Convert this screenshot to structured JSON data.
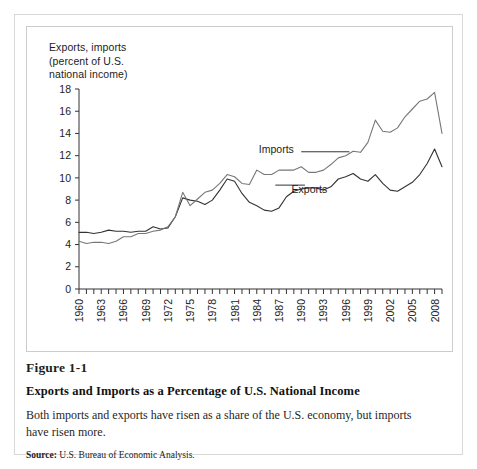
{
  "figure": {
    "number": "Figure 1-1",
    "title": "Exports and Imports as a Percentage of U.S. National Income",
    "description": "Both imports and exports have risen as a share of the U.S. economy, but imports have risen more.",
    "source_label": "Source:",
    "source_text": "U.S. Bureau of Economic Analysis."
  },
  "chart_data": {
    "type": "line",
    "title": "",
    "axis_title": "Exports, imports\n(percent of U.S.\nnational income)",
    "xlabel": "",
    "ylabel": "Exports, imports (percent of U.S. national income)",
    "ylim": [
      0,
      18
    ],
    "yticks": [
      0,
      2,
      4,
      6,
      8,
      10,
      12,
      14,
      16,
      18
    ],
    "xlim": [
      1960,
      2009
    ],
    "xticks_labeled": [
      1960,
      1963,
      1966,
      1969,
      1972,
      1975,
      1978,
      1981,
      1984,
      1987,
      1990,
      1993,
      1996,
      1999,
      2002,
      2005,
      2008
    ],
    "xtick_interval_minor": 1,
    "grid": false,
    "legend": "inline-annotations",
    "x": [
      1960,
      1961,
      1962,
      1963,
      1964,
      1965,
      1966,
      1967,
      1968,
      1969,
      1970,
      1971,
      1972,
      1973,
      1974,
      1975,
      1976,
      1977,
      1978,
      1979,
      1980,
      1981,
      1982,
      1983,
      1984,
      1985,
      1986,
      1987,
      1988,
      1989,
      1990,
      1991,
      1992,
      1993,
      1994,
      1995,
      1996,
      1997,
      1998,
      1999,
      2000,
      2001,
      2002,
      2003,
      2004,
      2005,
      2006,
      2007,
      2008,
      2009
    ],
    "series": [
      {
        "name": "Exports",
        "color": "#333333",
        "values": [
          5.1,
          5.1,
          5.0,
          5.1,
          5.3,
          5.2,
          5.2,
          5.1,
          5.2,
          5.2,
          5.6,
          5.4,
          5.5,
          6.5,
          8.2,
          8.0,
          7.9,
          7.6,
          8.0,
          8.9,
          9.9,
          9.7,
          8.6,
          7.8,
          7.5,
          7.1,
          7.0,
          7.3,
          8.3,
          8.8,
          9.0,
          9.1,
          9.1,
          8.9,
          9.2,
          9.9,
          10.1,
          10.4,
          9.9,
          9.7,
          10.3,
          9.5,
          8.9,
          8.8,
          9.2,
          9.6,
          10.3,
          11.3,
          12.6,
          11.0
        ]
      },
      {
        "name": "Imports",
        "color": "#777777",
        "values": [
          4.3,
          4.1,
          4.2,
          4.2,
          4.1,
          4.3,
          4.7,
          4.7,
          5.0,
          5.0,
          5.2,
          5.3,
          5.6,
          6.5,
          8.7,
          7.5,
          8.1,
          8.7,
          8.9,
          9.5,
          10.3,
          10.1,
          9.5,
          9.4,
          10.7,
          10.3,
          10.3,
          10.7,
          10.7,
          10.7,
          11.0,
          10.5,
          10.5,
          10.7,
          11.2,
          11.8,
          12.0,
          12.4,
          12.3,
          13.2,
          15.2,
          14.2,
          14.1,
          14.5,
          15.5,
          16.2,
          16.9,
          17.1,
          17.7,
          14.0
        ]
      }
    ],
    "annotations": [
      {
        "text": "Imports",
        "for": "Imports"
      },
      {
        "text": "Exports",
        "for": "Exports"
      }
    ]
  }
}
